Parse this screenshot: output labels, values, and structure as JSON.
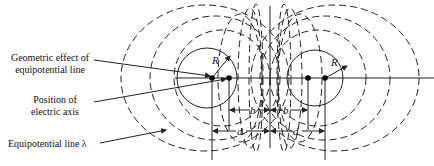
{
  "diagram": {
    "labels": {
      "geometric_effect_line1": "Geometric effect of",
      "geometric_effect_line2": "equipotential line",
      "position_line1": "Position of",
      "position_line2": "electric axis",
      "equipotential_line": "Equipotential line λ"
    },
    "symbols": {
      "radius_left": "R",
      "radius_right": "R",
      "b_left": "b",
      "b_right": "b",
      "d_left": "d",
      "d_right": "d"
    },
    "colors": {
      "stroke": "#222222",
      "text": "#111111",
      "background": "#ffffff"
    }
  }
}
